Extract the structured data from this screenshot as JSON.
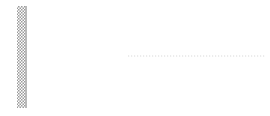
{
  "figure": {
    "background_color": "#ffffff",
    "width": 270,
    "height": 116
  },
  "wall": {
    "name": "fixed-support-wall",
    "hatch_color": "#9a9a9a",
    "edge_color": "#6e6e6e",
    "x": 17,
    "y": 6,
    "width": 9,
    "height": 102
  },
  "beam": {
    "fill_top_color": "#fdfdfd",
    "fill_bottom_color": "#dcdcdc",
    "edge_color": "#4a4a4a",
    "axis_y": 56,
    "thickness": 9,
    "segments": [
      {
        "name": "beam-segment-left",
        "x_start": 26,
        "x_end": 128
      },
      {
        "name": "beam-segment-right",
        "x_start": 166,
        "x_end": 232
      }
    ]
  },
  "dotted_axis": {
    "name": "centerline-dotted",
    "color": "#c9c9c9",
    "y": 56,
    "x_start": 128,
    "x_end": 266
  },
  "element_boxes": [
    {
      "id": "element-1",
      "label": "1",
      "italic": false,
      "cx": 60,
      "cy": 30,
      "w": 21,
      "h": 21
    },
    {
      "id": "element-2",
      "label": "2",
      "italic": false,
      "cx": 103,
      "cy": 30,
      "w": 21,
      "h": 21
    },
    {
      "id": "element-i",
      "label": "i",
      "italic": true,
      "cx": 197,
      "cy": 30,
      "w": 21,
      "h": 21
    }
  ],
  "nodes": [
    {
      "id": "node-1",
      "label": "1",
      "shape": "circle",
      "italic": false,
      "dot_x": 27,
      "dot_y": 56,
      "cx": 29,
      "cy": 74,
      "rx": 6.5,
      "ry": 6.5
    },
    {
      "id": "node-2",
      "label": "2",
      "shape": "circle",
      "italic": false,
      "dot_x": 78,
      "dot_y": 56,
      "cx": 78,
      "cy": 74,
      "rx": 6.5,
      "ry": 6.5
    },
    {
      "id": "node-3",
      "label": "3",
      "shape": "circle",
      "italic": false,
      "dot_x": 126,
      "dot_y": 56,
      "cx": 125,
      "cy": 74,
      "rx": 6.5,
      "ry": 6.5
    },
    {
      "id": "node-j",
      "label": "j",
      "shape": "circle",
      "italic": true,
      "dot_x": 169,
      "dot_y": 56,
      "cx": 172,
      "cy": 75,
      "rx": 10,
      "ry": 9
    },
    {
      "id": "node-j-plus-1",
      "label": "j+1",
      "shape": "ellipse",
      "italic": true,
      "dot_x": 230,
      "dot_y": 56,
      "cx": 231,
      "cy": 76,
      "rx": 17,
      "ry": 9.5
    }
  ],
  "node_dot": {
    "color": "#1a1a1a",
    "radius": 2.4
  },
  "end_caps": {
    "color": "#2e2e2e",
    "positions": [
      128,
      166,
      232
    ]
  }
}
